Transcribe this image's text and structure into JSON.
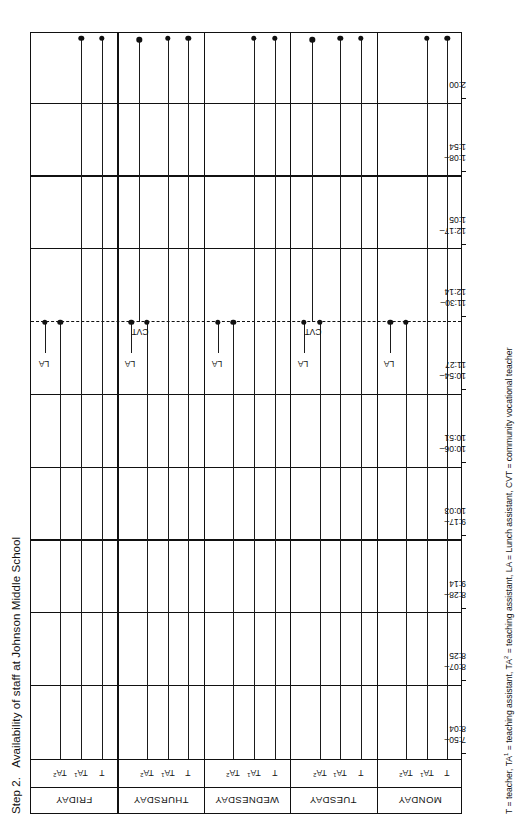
{
  "figure": {
    "step_label": "Step 2.",
    "title": "Availability of staff at Johnson Middle School",
    "legend": "T = teacher, TA1 = teaching assistant, TA2 = teaching assistant, LA = Lunch assistant, CVT = community vocational teacher",
    "legend_parts": {
      "t": "T = teacher,",
      "ta1_pre": "TA",
      "ta1_sup": "1",
      "ta1_post": " = teaching assistant,",
      "ta2_pre": "TA",
      "ta2_sup": "2",
      "ta2_post": " = teaching assistant,",
      "la": "LA = Lunch assistant,",
      "cvt": "CVT = community vocational teacher"
    }
  },
  "chart_data": {
    "type": "table",
    "title": "Availability of staff at Johnson Middle School",
    "xlabel": "",
    "ylabel": "",
    "grid": true,
    "legend_position": "below",
    "time_periods": [
      {
        "start": "7:50",
        "end": "8:04"
      },
      {
        "start": "8:07",
        "end": "8:25"
      },
      {
        "start": "8:28",
        "end": "9:14"
      },
      {
        "start": "9:17",
        "end": "10:03"
      },
      {
        "start": "10:06",
        "end": "10:51"
      },
      {
        "start": "10:54",
        "end": "11:27"
      },
      {
        "start": "11:30",
        "end": "12:14"
      },
      {
        "start": "12:17",
        "end": "1:05"
      },
      {
        "start": "1:08",
        "end": "1:54"
      },
      {
        "start": "2:00",
        "end": ""
      }
    ],
    "lunch_divider_after_period": 6,
    "days": [
      {
        "name": "MONDAY",
        "roles": [
          {
            "code": "T",
            "sup": "",
            "start_period": 1,
            "end_period": 10,
            "label": ""
          },
          {
            "code": "TA",
            "sup": "1",
            "start_period": 1,
            "end_period": 10,
            "label": ""
          },
          {
            "code": "TA",
            "sup": "2",
            "start_period": 1,
            "end_period": 6,
            "label": ""
          },
          {
            "code": "",
            "sup": "",
            "start_period": 6,
            "end_period": 6,
            "label": "LA"
          }
        ]
      },
      {
        "name": "TUESDAY",
        "roles": [
          {
            "code": "T",
            "sup": "",
            "start_period": 1,
            "end_period": 10,
            "label": ""
          },
          {
            "code": "TA",
            "sup": "1",
            "start_period": 1,
            "end_period": 10,
            "label": ""
          },
          {
            "code": "TA",
            "sup": "2",
            "start_period": 1,
            "end_period": 6,
            "label": ""
          },
          {
            "code": "",
            "sup": "",
            "start_period": 6,
            "end_period": 6,
            "label": "LA"
          },
          {
            "code": "",
            "sup": "",
            "start_period": 7,
            "end_period": 10,
            "label": "CVT"
          }
        ]
      },
      {
        "name": "WEDNESDAY",
        "roles": [
          {
            "code": "T",
            "sup": "",
            "start_period": 1,
            "end_period": 10,
            "label": ""
          },
          {
            "code": "TA",
            "sup": "1",
            "start_period": 1,
            "end_period": 10,
            "label": ""
          },
          {
            "code": "TA",
            "sup": "2",
            "start_period": 1,
            "end_period": 6,
            "label": ""
          },
          {
            "code": "",
            "sup": "",
            "start_period": 6,
            "end_period": 6,
            "label": "LA"
          }
        ]
      },
      {
        "name": "THURSDAY",
        "roles": [
          {
            "code": "T",
            "sup": "",
            "start_period": 1,
            "end_period": 10,
            "label": ""
          },
          {
            "code": "TA",
            "sup": "1",
            "start_period": 1,
            "end_period": 10,
            "label": ""
          },
          {
            "code": "TA",
            "sup": "2",
            "start_period": 1,
            "end_period": 6,
            "label": ""
          },
          {
            "code": "",
            "sup": "",
            "start_period": 6,
            "end_period": 6,
            "label": "LA"
          },
          {
            "code": "",
            "sup": "",
            "start_period": 7,
            "end_period": 10,
            "label": "CVT"
          }
        ]
      },
      {
        "name": "FRIDAY",
        "roles": [
          {
            "code": "T",
            "sup": "",
            "start_period": 1,
            "end_period": 10,
            "label": ""
          },
          {
            "code": "TA",
            "sup": "1",
            "start_period": 1,
            "end_period": 10,
            "label": ""
          },
          {
            "code": "TA",
            "sup": "2",
            "start_period": 1,
            "end_period": 6,
            "label": ""
          },
          {
            "code": "",
            "sup": "",
            "start_period": 6,
            "end_period": 6,
            "label": "LA"
          }
        ]
      }
    ]
  }
}
